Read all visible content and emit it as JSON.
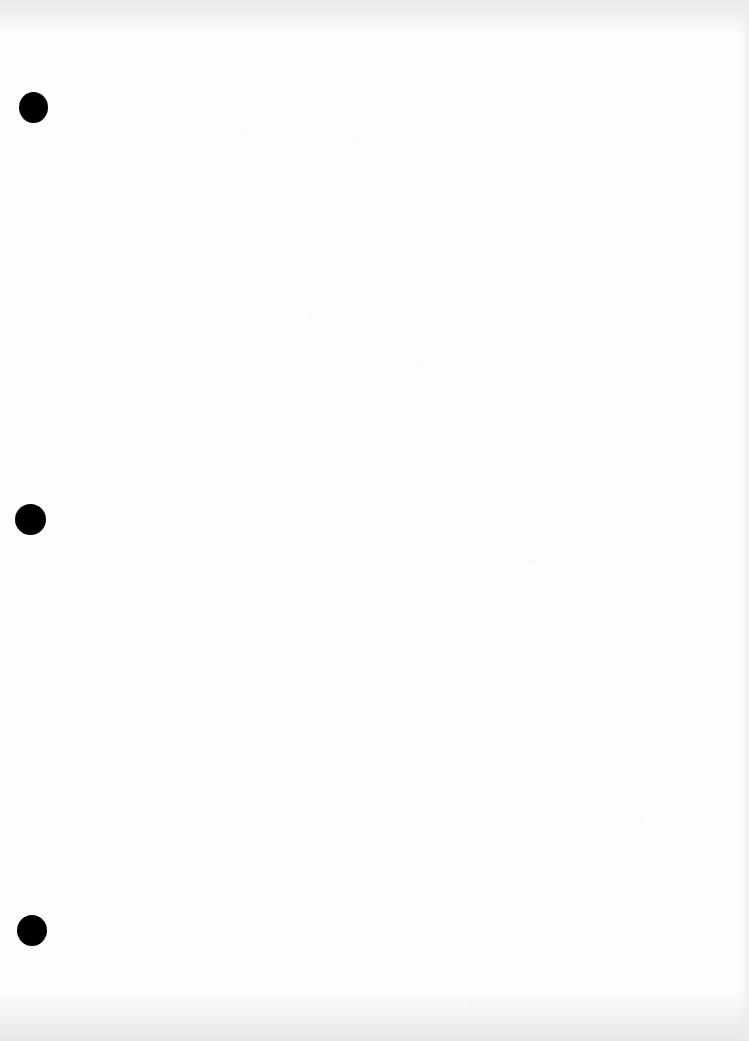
{
  "document": {
    "type": "blank-scanned-page",
    "background_color": "#fdfdfd",
    "text_content": ""
  },
  "punch_holes": [
    {
      "label": "top",
      "x": 19,
      "y": 92,
      "width": 29,
      "height": 31,
      "color": "#000000"
    },
    {
      "label": "middle",
      "x": 15,
      "y": 504,
      "width": 31,
      "height": 31,
      "color": "#000000"
    },
    {
      "label": "bottom",
      "x": 17,
      "y": 915,
      "width": 30,
      "height": 31,
      "color": "#000000"
    }
  ]
}
